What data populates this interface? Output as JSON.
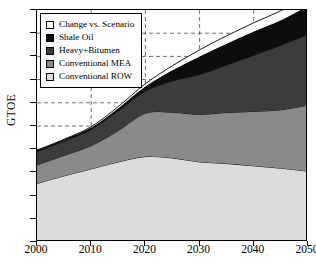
{
  "figure": {
    "ylabel": "GTOE",
    "xlabel": ""
  },
  "legend": {
    "items": [
      {
        "label": "Change vs. Scenario",
        "color": "#ffffff"
      },
      {
        "label": "Shale Oil",
        "color": "#0d0d0d"
      },
      {
        "label": "Heavy+Bitumen",
        "color": "#3c3c3c"
      },
      {
        "label": "Conventional MEA",
        "color": "#8a8a8a"
      },
      {
        "label": "Conventional ROW",
        "color": "#dcdcdc"
      }
    ]
  },
  "axes": {
    "y_ticks": [
      "0",
      "1",
      "2",
      "3",
      "4",
      "5",
      "6",
      "7",
      "8",
      "9",
      "10"
    ],
    "x_ticks": [
      "2000",
      "2010",
      "2020",
      "2030",
      "2040",
      "2050"
    ]
  },
  "chart_data": {
    "type": "area",
    "title": "",
    "xlabel": "",
    "ylabel": "GTOE",
    "xlim": [
      2000,
      2050
    ],
    "ylim": [
      0,
      10
    ],
    "grid": true,
    "stacked": true,
    "legend_position": "upper-left",
    "x": [
      2000,
      2005,
      2010,
      2015,
      2020,
      2025,
      2030,
      2035,
      2040,
      2045,
      2050
    ],
    "series": [
      {
        "name": "Conventional ROW",
        "color": "#dcdcdc",
        "values": [
          2.52,
          2.85,
          3.15,
          3.45,
          3.68,
          3.62,
          3.45,
          3.38,
          3.28,
          3.18,
          3.05
        ]
      },
      {
        "name": "Conventional MEA",
        "color": "#8a8a8a",
        "values": [
          0.8,
          0.88,
          1.0,
          1.35,
          1.87,
          1.97,
          2.05,
          2.2,
          2.35,
          2.52,
          2.85
        ]
      },
      {
        "name": "Heavy+Bitumen",
        "color": "#3c3c3c",
        "values": [
          0.58,
          0.62,
          0.7,
          0.85,
          0.95,
          1.35,
          1.72,
          2.05,
          2.42,
          2.78,
          3.05
        ]
      },
      {
        "name": "Shale Oil",
        "color": "#0d0d0d",
        "values": [
          0.05,
          0.06,
          0.08,
          0.12,
          0.2,
          0.46,
          0.78,
          0.92,
          1.02,
          1.08,
          1.22
        ]
      },
      {
        "name": "Change vs. Scenario",
        "color": "#ffffff",
        "values": [
          0.0,
          0.02,
          0.04,
          0.07,
          0.12,
          0.2,
          0.28,
          0.34,
          0.38,
          0.41,
          0.43
        ]
      }
    ],
    "cumulative_top": [
      3.95,
      4.43,
      4.97,
      5.84,
      6.82,
      7.6,
      8.28,
      8.89,
      9.45,
      9.97,
      10.6
    ]
  }
}
